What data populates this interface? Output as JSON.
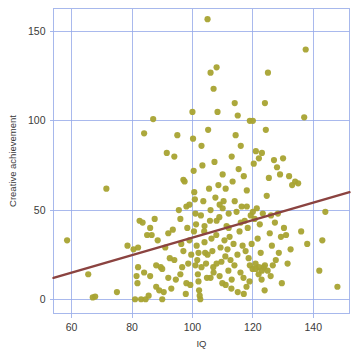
{
  "chart_data": {
    "type": "scatter",
    "title": "",
    "subtitle": "",
    "xlabel": "IQ",
    "ylabel": "Creative achievement",
    "xlim": [
      54,
      152
    ],
    "ylim": [
      -8,
      163
    ],
    "xticks": [
      60,
      80,
      100,
      120,
      140
    ],
    "yticks": [
      0,
      50,
      100,
      150
    ],
    "xtick_labels": [
      "60",
      "80",
      "100",
      "120",
      "140"
    ],
    "ytick_labels": [
      "0",
      "50",
      "100",
      "150"
    ],
    "grid": true,
    "grid_color": "#93a8e8",
    "frame_color": "#9db0ea",
    "background": "#ffffff",
    "legend": null,
    "point_color": "#a8a332",
    "point_radius": 3.1,
    "point_opacity": 0.95,
    "series": [
      {
        "name": "participants",
        "marker": "circle",
        "color": "#a8a332",
        "points": [
          [
            58.5,
            33
          ],
          [
            65.5,
            14
          ],
          [
            67,
            1
          ],
          [
            67.8,
            1.5
          ],
          [
            71.5,
            62
          ],
          [
            75,
            4
          ],
          [
            78.5,
            30
          ],
          [
            80.5,
            28
          ],
          [
            81,
            0
          ],
          [
            81.5,
            13
          ],
          [
            81.8,
            9
          ],
          [
            82,
            18
          ],
          [
            82.5,
            44
          ],
          [
            83,
            0
          ],
          [
            83.5,
            43
          ],
          [
            84,
            93
          ],
          [
            84.5,
            0
          ],
          [
            85,
            36
          ],
          [
            85.5,
            2
          ],
          [
            86,
            40
          ],
          [
            86.5,
            36
          ],
          [
            87,
            101
          ],
          [
            87.5,
            45
          ],
          [
            88,
            19
          ],
          [
            88.5,
            33
          ],
          [
            89,
            5
          ],
          [
            89.5,
            18
          ],
          [
            90,
            0
          ],
          [
            90.5,
            4
          ],
          [
            91,
            29
          ],
          [
            91.5,
            82
          ],
          [
            92,
            37
          ],
          [
            92.5,
            23
          ],
          [
            93,
            6
          ],
          [
            93.5,
            39
          ],
          [
            94,
            80
          ],
          [
            94.5,
            11
          ],
          [
            95,
            92
          ],
          [
            95.5,
            50
          ],
          [
            96,
            45
          ],
          [
            96.3,
            31
          ],
          [
            96.6,
            18
          ],
          [
            97,
            67
          ],
          [
            97.4,
            66
          ],
          [
            97.8,
            3
          ],
          [
            98,
            52
          ],
          [
            98.3,
            40
          ],
          [
            98.6,
            20
          ],
          [
            99,
            33
          ],
          [
            99.3,
            8
          ],
          [
            99.6,
            25
          ],
          [
            100,
            105
          ],
          [
            100.2,
            90
          ],
          [
            100.4,
            72
          ],
          [
            100.6,
            60
          ],
          [
            100.8,
            56
          ],
          [
            101,
            48
          ],
          [
            101.2,
            42
          ],
          [
            101.4,
            30
          ],
          [
            101.6,
            22
          ],
          [
            101.8,
            14
          ],
          [
            102,
            10
          ],
          [
            102.2,
            5
          ],
          [
            102.4,
            2
          ],
          [
            102.6,
            0
          ],
          [
            103,
            86
          ],
          [
            103.3,
            75
          ],
          [
            103.6,
            55
          ],
          [
            103.9,
            38
          ],
          [
            104.2,
            26
          ],
          [
            104.5,
            20
          ],
          [
            104.8,
            12
          ],
          [
            105,
            157
          ],
          [
            105.2,
            95
          ],
          [
            105.5,
            62
          ],
          [
            105.8,
            44
          ],
          [
            106,
            127
          ],
          [
            106.3,
            34
          ],
          [
            106.6,
            27
          ],
          [
            106.9,
            18
          ],
          [
            107,
            118
          ],
          [
            107.3,
            77
          ],
          [
            107.6,
            57
          ],
          [
            107.9,
            36
          ],
          [
            108,
            130
          ],
          [
            108.3,
            105
          ],
          [
            108.6,
            64
          ],
          [
            108.9,
            46
          ],
          [
            109,
            53
          ],
          [
            109.3,
            29
          ],
          [
            109.6,
            21
          ],
          [
            109.9,
            9
          ],
          [
            110,
            70
          ],
          [
            110.3,
            55
          ],
          [
            110.6,
            33
          ],
          [
            110.9,
            24
          ],
          [
            111,
            62
          ],
          [
            111.3,
            41
          ],
          [
            111.6,
            28
          ],
          [
            111.9,
            16
          ],
          [
            112,
            48
          ],
          [
            112.3,
            35
          ],
          [
            112.6,
            22
          ],
          [
            112.9,
            6
          ],
          [
            113,
            80
          ],
          [
            113.3,
            66
          ],
          [
            113.6,
            31
          ],
          [
            113.9,
            19
          ],
          [
            114,
            110
          ],
          [
            114.3,
            92
          ],
          [
            114.6,
            49
          ],
          [
            114.9,
            25
          ],
          [
            115,
            103
          ],
          [
            115.3,
            73
          ],
          [
            115.6,
            38
          ],
          [
            115.9,
            15
          ],
          [
            116,
            86
          ],
          [
            116.3,
            52
          ],
          [
            116.6,
            30
          ],
          [
            116.9,
            12
          ],
          [
            117,
            69
          ],
          [
            117.3,
            44
          ],
          [
            117.6,
            27
          ],
          [
            117.9,
            7
          ],
          [
            118,
            61
          ],
          [
            118.3,
            40
          ],
          [
            118.6,
            23
          ],
          [
            118.9,
            10
          ],
          [
            119,
            100
          ],
          [
            119.3,
            47
          ],
          [
            119.6,
            31
          ],
          [
            119.9,
            17
          ],
          [
            120,
            100
          ],
          [
            120.3,
            76
          ],
          [
            120.6,
            45
          ],
          [
            120.9,
            20
          ],
          [
            121,
            83
          ],
          [
            121.3,
            51
          ],
          [
            121.6,
            34
          ],
          [
            121.9,
            14
          ],
          [
            122,
            79
          ],
          [
            122.3,
            42
          ],
          [
            122.6,
            26
          ],
          [
            122.9,
            11
          ],
          [
            123,
            82
          ],
          [
            123.3,
            48
          ],
          [
            123.6,
            18
          ],
          [
            123.9,
            5
          ],
          [
            124,
            110
          ],
          [
            124.3,
            95
          ],
          [
            124.6,
            58
          ],
          [
            124.9,
            16
          ],
          [
            125,
            127
          ],
          [
            125.3,
            68
          ],
          [
            125.6,
            37
          ],
          [
            125.9,
            13
          ],
          [
            126,
            47
          ],
          [
            126.3,
            30
          ],
          [
            126.6,
            19
          ],
          [
            127,
            78
          ],
          [
            127.3,
            43
          ],
          [
            127.6,
            22
          ],
          [
            128,
            74
          ],
          [
            128.3,
            48
          ],
          [
            128.6,
            26
          ],
          [
            129,
            70
          ],
          [
            129.3,
            35
          ],
          [
            129.6,
            9
          ],
          [
            130,
            79
          ],
          [
            130.3,
            40
          ],
          [
            131,
            36
          ],
          [
            131.5,
            20
          ],
          [
            132,
            69
          ],
          [
            132.5,
            28
          ],
          [
            133,
            64
          ],
          [
            134,
            66
          ],
          [
            135,
            65
          ],
          [
            136,
            38
          ],
          [
            137,
            102
          ],
          [
            137.5,
            140
          ],
          [
            138,
            31
          ],
          [
            142,
            16
          ],
          [
            143,
            33
          ],
          [
            144,
            49
          ],
          [
            148,
            7
          ],
          [
            99,
            53
          ],
          [
            100.5,
            38
          ],
          [
            102.8,
            47
          ],
          [
            104,
            41
          ],
          [
            106,
            50
          ],
          [
            108,
            44
          ],
          [
            110,
            51
          ],
          [
            112,
            40
          ],
          [
            114,
            55
          ],
          [
            116,
            43
          ],
          [
            118,
            52
          ],
          [
            120,
            49
          ],
          [
            103,
            18
          ],
          [
            105,
            25
          ],
          [
            107,
            15
          ],
          [
            109,
            13
          ],
          [
            111,
            8
          ],
          [
            113,
            11
          ],
          [
            115,
            4
          ],
          [
            117,
            3
          ],
          [
            119,
            19
          ],
          [
            121,
            17
          ],
          [
            122,
            18
          ],
          [
            123,
            16
          ],
          [
            124,
            19
          ],
          [
            101,
            19
          ],
          [
            102,
            26
          ],
          [
            104,
            32
          ],
          [
            106,
            12
          ],
          [
            108,
            20
          ],
          [
            96,
            14
          ],
          [
            97,
            27
          ],
          [
            98,
            9
          ],
          [
            94,
            22
          ],
          [
            92,
            12
          ],
          [
            90,
            17
          ],
          [
            88,
            7
          ],
          [
            86,
            13
          ],
          [
            84,
            15
          ],
          [
            82,
            29
          ]
        ]
      }
    ],
    "trendline": {
      "name": "regression-line",
      "color": "#8b4340",
      "width": 2.4,
      "x_start": 54,
      "y_start": 12,
      "x_end": 152,
      "y_end": 60
    }
  },
  "axes": {
    "x_axis_name": "IQ",
    "y_axis_name": "Creative achievement"
  }
}
